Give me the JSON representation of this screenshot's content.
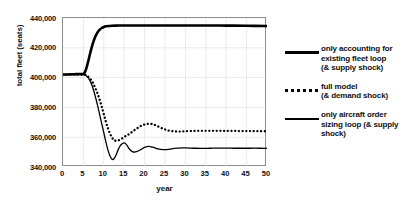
{
  "chart_data": {
    "type": "line",
    "title": "",
    "xlabel": "year",
    "ylabel": "total fleet (seats)",
    "xlim": [
      0,
      50
    ],
    "ylim": [
      340000,
      440000
    ],
    "xticks": [
      0,
      5,
      10,
      15,
      20,
      25,
      30,
      35,
      40,
      45,
      50
    ],
    "yticks": [
      340000,
      360000,
      380000,
      400000,
      420000,
      440000
    ],
    "ytick_labels": [
      "340,000",
      "360,000",
      "380,000",
      "400,000",
      "420,000",
      "440,000"
    ],
    "xtick_labels": [
      "0",
      "5",
      "10",
      "15",
      "20",
      "25",
      "30",
      "35",
      "40",
      "45",
      "50"
    ],
    "grid": true,
    "grid_color": "#e3e3e3",
    "legend_position": "right",
    "series": [
      {
        "name": "only accounting for existing fleet loop (& supply shock)",
        "style": "solid-thick",
        "color": "#000000",
        "x": [
          0,
          1,
          2,
          3,
          4,
          5,
          5.5,
          6,
          6.5,
          7,
          7.5,
          8,
          8.5,
          9,
          9.5,
          10,
          10.5,
          11,
          12,
          13,
          14,
          15,
          16,
          18,
          20,
          25,
          30,
          35,
          40,
          45,
          50
        ],
        "y": [
          402000,
          402100,
          402200,
          402300,
          402400,
          402500,
          404500,
          409000,
          414500,
          420000,
          424500,
          428000,
          430500,
          432200,
          433300,
          434000,
          434400,
          434600,
          434800,
          434900,
          434950,
          435000,
          435000,
          435000,
          435000,
          435000,
          435000,
          435000,
          434900,
          434800,
          434600
        ]
      },
      {
        "name": "full model (& demand shock)",
        "style": "dotted",
        "color": "#000000",
        "x": [
          0,
          1,
          2,
          3,
          4,
          5,
          5.5,
          6,
          6.5,
          7,
          7.5,
          8,
          8.5,
          9,
          9.5,
          10,
          10.5,
          11,
          11.5,
          12,
          12.5,
          13,
          14,
          15,
          16,
          17,
          18,
          19,
          20,
          21,
          22,
          23,
          24,
          25,
          26,
          27,
          28,
          29,
          30,
          32,
          34,
          36,
          38,
          40,
          42,
          44,
          46,
          48,
          50
        ],
        "y": [
          402000,
          402000,
          402000,
          402000,
          402000,
          402000,
          401800,
          401000,
          399800,
          398000,
          395500,
          392500,
          389000,
          385000,
          380500,
          375500,
          370500,
          366000,
          362500,
          359800,
          358200,
          357600,
          358300,
          360200,
          361800,
          363700,
          365700,
          367400,
          368500,
          369000,
          368700,
          367600,
          366300,
          365200,
          364400,
          364000,
          363800,
          363800,
          364000,
          364200,
          364300,
          364300,
          364300,
          364200,
          364200,
          364100,
          364100,
          364000,
          364000
        ]
      },
      {
        "name": "only aircraft order sizing loop (& supply shock)",
        "style": "solid-thin",
        "color": "#000000",
        "x": [
          0,
          1,
          2,
          3,
          4,
          5,
          5.5,
          6,
          6.5,
          7,
          7.5,
          8,
          8.5,
          9,
          9.5,
          10,
          10.5,
          11,
          11.5,
          12,
          12.5,
          13,
          13.5,
          14,
          14.5,
          15,
          15.5,
          16,
          16.5,
          17,
          17.5,
          18,
          19,
          20,
          21,
          22,
          23,
          24,
          25,
          26,
          27,
          28,
          30,
          32,
          34,
          36,
          38,
          40,
          42,
          44,
          46,
          48,
          50
        ],
        "y": [
          402000,
          402000,
          402000,
          402000,
          402000,
          402000,
          401600,
          400500,
          398500,
          395500,
          391500,
          386500,
          381000,
          375000,
          369000,
          363000,
          357000,
          351500,
          347500,
          345200,
          345500,
          348000,
          351500,
          354200,
          355600,
          356200,
          355200,
          353200,
          351400,
          350300,
          350000,
          350300,
          351600,
          353200,
          353800,
          353300,
          352400,
          351800,
          351600,
          351900,
          352400,
          352700,
          352800,
          352600,
          352500,
          352600,
          352700,
          352700,
          352600,
          352600,
          352600,
          352600,
          352500
        ]
      }
    ]
  },
  "legend": {
    "items": [
      {
        "label_line1": "only accounting for",
        "label_line2": "existing fleet loop",
        "label_line3": "(& supply shock)",
        "style": "solid-thick"
      },
      {
        "label_line1": "full model",
        "label_line2": "(& demand shock)",
        "label_line3": "",
        "style": "dotted"
      },
      {
        "label_line1": "only aircraft order",
        "label_line2": "sizing loop (& supply",
        "label_line3": "shock)",
        "style": "solid-thin"
      }
    ]
  }
}
